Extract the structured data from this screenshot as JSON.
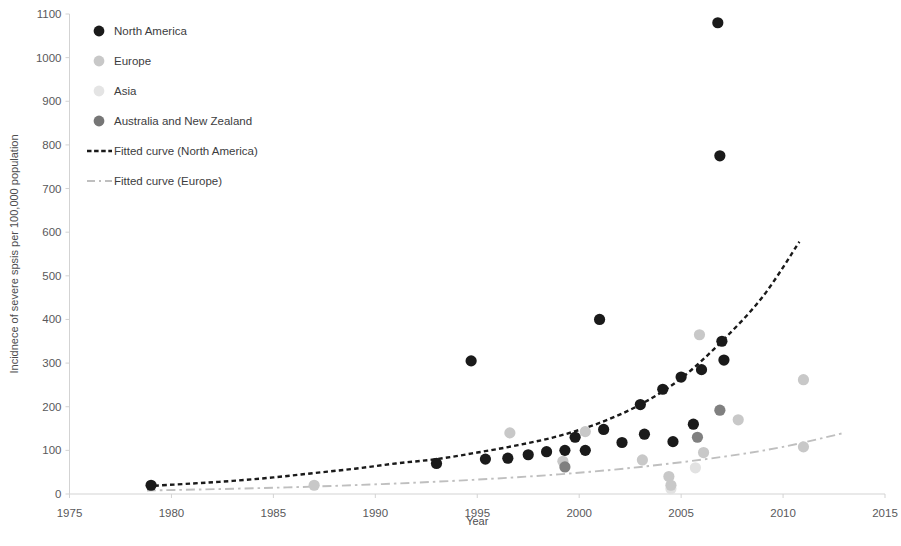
{
  "chart_data": {
    "type": "scatter",
    "title": "",
    "xlabel": "Year",
    "ylabel": "Incidnece of severe spsis per 100,000 population",
    "xlim": [
      1975,
      2015
    ],
    "ylim": [
      0,
      1100
    ],
    "xticks": [
      1975,
      1980,
      1985,
      1990,
      1995,
      2000,
      2005,
      2010,
      2015
    ],
    "yticks": [
      0,
      100,
      200,
      300,
      400,
      500,
      600,
      700,
      800,
      900,
      1000,
      1100
    ],
    "grid": false,
    "legend_position": "upper-left-inside",
    "series": [
      {
        "name": "North America",
        "marker": "circle",
        "color": "#1a1a1a",
        "points": [
          [
            1979,
            20
          ],
          [
            1993,
            70
          ],
          [
            1994.7,
            305
          ],
          [
            1995.4,
            80
          ],
          [
            1996.5,
            82
          ],
          [
            1997.5,
            90
          ],
          [
            1998.4,
            97
          ],
          [
            1999.3,
            100
          ],
          [
            1999.8,
            130
          ],
          [
            2000.3,
            100
          ],
          [
            2001,
            400
          ],
          [
            2001.2,
            148
          ],
          [
            2002.1,
            118
          ],
          [
            2003,
            205
          ],
          [
            2003.2,
            137
          ],
          [
            2004.1,
            240
          ],
          [
            2004.6,
            120
          ],
          [
            2005,
            268
          ],
          [
            2005.6,
            160
          ],
          [
            2006,
            285
          ],
          [
            2006.8,
            1080
          ],
          [
            2006.9,
            775
          ],
          [
            2007,
            350
          ],
          [
            2007.1,
            307
          ]
        ]
      },
      {
        "name": "Europe",
        "marker": "circle",
        "color": "#c8c8c8",
        "points": [
          [
            1987,
            20
          ],
          [
            1996.6,
            140
          ],
          [
            1999.2,
            75
          ],
          [
            2000.3,
            143
          ],
          [
            2003.1,
            78
          ],
          [
            2004.4,
            40
          ],
          [
            2004.5,
            20
          ],
          [
            2005.9,
            365
          ],
          [
            2006.1,
            95
          ],
          [
            2007.8,
            170
          ],
          [
            2011,
            262
          ],
          [
            2011,
            108
          ]
        ]
      },
      {
        "name": "Asia",
        "marker": "circle",
        "color": "#e2e2e2",
        "points": [
          [
            2004.5,
            12
          ],
          [
            2005.7,
            60
          ]
        ]
      },
      {
        "name": "Australia and New Zealand",
        "marker": "circle",
        "color": "#808080",
        "points": [
          [
            1999.3,
            62
          ],
          [
            2005.8,
            130
          ],
          [
            2006.9,
            192
          ]
        ]
      }
    ],
    "fitted_curves": [
      {
        "name": "Fitted curve (North America)",
        "style": "dashed",
        "color": "#1a1a1a",
        "x_range": [
          1978.8,
          2010.8
        ],
        "points": [
          [
            1978.8,
            18
          ],
          [
            1981,
            24
          ],
          [
            1983,
            30
          ],
          [
            1985,
            38
          ],
          [
            1987,
            48
          ],
          [
            1989,
            58
          ],
          [
            1991,
            70
          ],
          [
            1993,
            80
          ],
          [
            1995,
            95
          ],
          [
            1997,
            112
          ],
          [
            1999,
            133
          ],
          [
            2001,
            163
          ],
          [
            2003,
            205
          ],
          [
            2005,
            265
          ],
          [
            2007,
            350
          ],
          [
            2009,
            452
          ],
          [
            2010.8,
            578
          ]
        ]
      },
      {
        "name": "Fitted curve (Europe)",
        "style": "dash-dot",
        "color": "#bfbfbf",
        "x_range": [
          1978.8,
          2013
        ],
        "points": [
          [
            1978.8,
            8
          ],
          [
            1983,
            12
          ],
          [
            1987,
            17
          ],
          [
            1991,
            24
          ],
          [
            1995,
            33
          ],
          [
            1999,
            45
          ],
          [
            2003,
            62
          ],
          [
            2007,
            85
          ],
          [
            2010,
            108
          ],
          [
            2013,
            140
          ]
        ]
      }
    ],
    "annotations": []
  },
  "legend": {
    "entries": [
      {
        "label": "North America",
        "symbol": "circle",
        "color": "#1a1a1a"
      },
      {
        "label": "Europe",
        "symbol": "circle",
        "color": "#c8c8c8"
      },
      {
        "label": "Asia",
        "symbol": "circle",
        "color": "#e4e4e4"
      },
      {
        "label": "Australia and New Zealand",
        "symbol": "circle",
        "color": "#767676"
      },
      {
        "label": "Fitted curve (North America)",
        "symbol": "dashed-line",
        "color": "#1a1a1a"
      },
      {
        "label": "Fitted curve (Europe)",
        "symbol": "dash-dot-line",
        "color": "#bfbfbf"
      }
    ]
  },
  "axes": {
    "x_title": "Year",
    "y_title": "Incidnece of severe spsis per 100,000 population",
    "x_tick_labels": [
      "1975",
      "1980",
      "1985",
      "1990",
      "1995",
      "2000",
      "2005",
      "2010",
      "2015"
    ],
    "y_tick_labels": [
      "0",
      "100",
      "200",
      "300",
      "400",
      "500",
      "600",
      "700",
      "800",
      "900",
      "1000",
      "1100"
    ]
  },
  "colors": {
    "north_america": "#1a1a1a",
    "europe": "#c8c8c8",
    "asia": "#e4e4e4",
    "anz": "#808080",
    "axis": "#d3d3d3",
    "text": "#4d4d4f"
  }
}
